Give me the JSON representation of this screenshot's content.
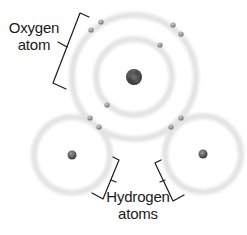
{
  "diagram": {
    "labels": {
      "oxygen_line1": "Oxygen",
      "oxygen_line2": "atom",
      "hydrogen_line1": "Hydrogen",
      "hydrogen_line2": "atoms"
    },
    "colors": {
      "orbit": "#e4e4e4",
      "electron": "#8a8a8a",
      "nucleus_oxygen": "#4a4a4a",
      "nucleus_hydrogen": "#5a5a5a",
      "bracket": "#1a1a1a",
      "text": "#1a1a1a"
    },
    "atoms": [
      {
        "name": "oxygen",
        "nucleus": {
          "x": 134,
          "y": 77,
          "r": 8
        },
        "orbits": [
          {
            "r": 38
          },
          {
            "r": 62
          }
        ],
        "electrons": [
          {
            "x": 101,
            "y": 22
          },
          {
            "x": 91,
            "y": 30
          },
          {
            "x": 173,
            "y": 25
          },
          {
            "x": 181,
            "y": 34
          },
          {
            "x": 160,
            "y": 45
          },
          {
            "x": 107,
            "y": 105
          }
        ]
      },
      {
        "name": "hydrogen-left",
        "nucleus": {
          "x": 72,
          "y": 155,
          "r": 4
        },
        "orbits": [
          {
            "r": 38
          }
        ],
        "electrons": [
          {
            "x": 90,
            "y": 118
          },
          {
            "x": 99,
            "y": 127
          }
        ]
      },
      {
        "name": "hydrogen-right",
        "nucleus": {
          "x": 203,
          "y": 154,
          "r": 4
        },
        "orbits": [
          {
            "r": 38
          }
        ],
        "electrons": [
          {
            "x": 181,
            "y": 118
          },
          {
            "x": 171,
            "y": 127
          }
        ]
      }
    ]
  }
}
